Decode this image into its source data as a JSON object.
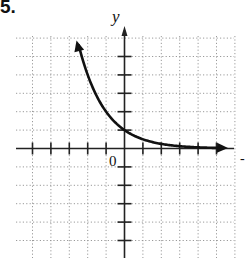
{
  "problem": {
    "number": "5."
  },
  "axes": {
    "y_label": "y",
    "x_label": "x",
    "origin_label": "0"
  },
  "colors": {
    "curve": "#111111",
    "grid": "#9a9a9a",
    "axis": "#222222"
  },
  "chart_data": {
    "type": "line",
    "title": "",
    "function": "y = (1/2)^x",
    "xlabel": "x",
    "ylabel": "y",
    "xlim": [
      -6,
      6
    ],
    "ylim": [
      -6,
      6
    ],
    "grid": true,
    "grid_style": "dotted",
    "origin_label": "0",
    "x": [
      -2.5,
      -2,
      -1.5,
      -1,
      -0.5,
      0,
      0.5,
      1,
      2,
      3,
      4,
      5.3
    ],
    "values": [
      5.66,
      4,
      2.83,
      2,
      1.41,
      1,
      0.71,
      0.5,
      0.25,
      0.125,
      0.0625,
      0.025
    ],
    "annotations": [
      "arrowhead at upper-left end",
      "arrowhead at right end approaching x-axis"
    ]
  }
}
